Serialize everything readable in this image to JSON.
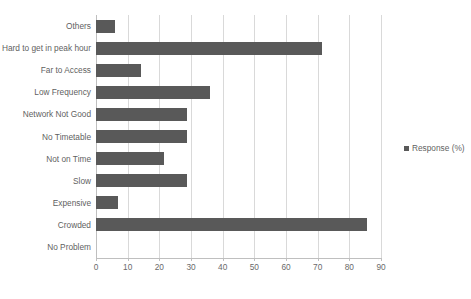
{
  "chart_data": {
    "type": "bar",
    "orientation": "horizontal",
    "title": "",
    "xlabel": "",
    "ylabel": "",
    "xlim": [
      0,
      90
    ],
    "xticks": [
      0,
      10,
      20,
      30,
      40,
      50,
      60,
      70,
      80,
      90
    ],
    "grid": true,
    "legend_position": "right",
    "series": [
      {
        "name": "Response (%)",
        "color": "#595959",
        "values": [
          6.0,
          71.5,
          14.3,
          36.0,
          28.7,
          28.7,
          21.5,
          28.7,
          6.8,
          85.5,
          0
        ]
      }
    ],
    "categories": [
      "Others",
      "Hard to get in peak hour",
      "Far to Access",
      "Low Frequency",
      "Network Not Good",
      "No Timetable",
      "Not on Time",
      "Slow",
      "Expensive",
      "Crowded",
      "No Problem"
    ]
  },
  "legend": {
    "entries": [
      {
        "label": "Response (%)",
        "color": "#595959"
      }
    ]
  },
  "colors": {
    "bar": "#595959",
    "gridline": "#d9d9d9",
    "axis": "#bfbfbf",
    "text": "#5f5f5f",
    "background": "#ffffff"
  },
  "title_sliver": "",
  "axis": {
    "tick_labels": [
      "0",
      "10",
      "20",
      "30",
      "40",
      "50",
      "60",
      "70",
      "80",
      "90"
    ]
  }
}
